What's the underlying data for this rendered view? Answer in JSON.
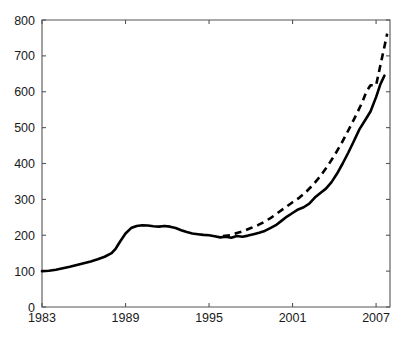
{
  "chart_data": {
    "type": "line",
    "title": "",
    "subtitle": "",
    "xlabel": "",
    "ylabel": "",
    "xlim": [
      1983,
      2008
    ],
    "ylim": [
      0,
      800
    ],
    "grid": false,
    "legend": "none",
    "xticks": [
      1983,
      1989,
      1995,
      2001,
      2007
    ],
    "xtick_labels": [
      "1983",
      "1989",
      "1995",
      "2001",
      "2007"
    ],
    "yticks": [
      0,
      100,
      200,
      300,
      400,
      500,
      600,
      700,
      800
    ],
    "ytick_labels": [
      "0",
      "100",
      "200",
      "300",
      "400",
      "500",
      "600",
      "700",
      "800"
    ],
    "series": [
      {
        "name": "solid-series",
        "style": "solid",
        "color": "#000000",
        "x": [
          1983.0,
          1983.5,
          1984.0,
          1984.5,
          1985.0,
          1985.5,
          1986.0,
          1986.5,
          1987.0,
          1987.5,
          1988.0,
          1988.3,
          1988.6,
          1989.0,
          1989.4,
          1989.8,
          1990.2,
          1990.6,
          1991.0,
          1991.4,
          1991.8,
          1992.2,
          1992.6,
          1993.0,
          1993.4,
          1993.8,
          1994.2,
          1994.6,
          1995.0,
          1995.4,
          1995.8,
          1996.2,
          1996.6,
          1997.0,
          1997.4,
          1997.8,
          1998.2,
          1998.6,
          1999.0,
          1999.4,
          1999.8,
          2000.2,
          2000.6,
          2001.0,
          2001.4,
          2001.8,
          2002.2,
          2002.6,
          2003.0,
          2003.4,
          2003.8,
          2004.2,
          2004.6,
          2005.0,
          2005.4,
          2005.8,
          2006.2,
          2006.6,
          2007.0,
          2007.3,
          2007.6
        ],
        "y": [
          100,
          101,
          104,
          108,
          112,
          117,
          122,
          127,
          133,
          140,
          150,
          163,
          182,
          205,
          220,
          226,
          228,
          227,
          225,
          224,
          226,
          224,
          220,
          214,
          209,
          205,
          203,
          201,
          200,
          197,
          194,
          196,
          193,
          198,
          196,
          199,
          203,
          207,
          212,
          220,
          228,
          240,
          252,
          262,
          272,
          278,
          288,
          305,
          318,
          330,
          348,
          372,
          400,
          430,
          462,
          495,
          520,
          545,
          585,
          620,
          645
        ]
      },
      {
        "name": "dashed-series",
        "style": "dashed",
        "color": "#000000",
        "x": [
          1996.0,
          1996.5,
          1997.0,
          1997.5,
          1998.0,
          1998.5,
          1999.0,
          1999.5,
          2000.0,
          2000.5,
          2001.0,
          2001.5,
          2002.0,
          2002.5,
          2003.0,
          2003.5,
          2004.0,
          2004.5,
          2005.0,
          2005.5,
          2006.0,
          2006.3,
          2006.6,
          2007.0,
          2007.4,
          2007.8
        ],
        "y": [
          198,
          200,
          206,
          212,
          220,
          228,
          238,
          250,
          264,
          278,
          292,
          305,
          322,
          342,
          365,
          392,
          422,
          455,
          492,
          530,
          570,
          600,
          618,
          618,
          690,
          762
        ]
      }
    ]
  },
  "axis": {
    "tick_color": "#555555",
    "line_color": "#555555",
    "label_color": "#1a1a1a"
  }
}
